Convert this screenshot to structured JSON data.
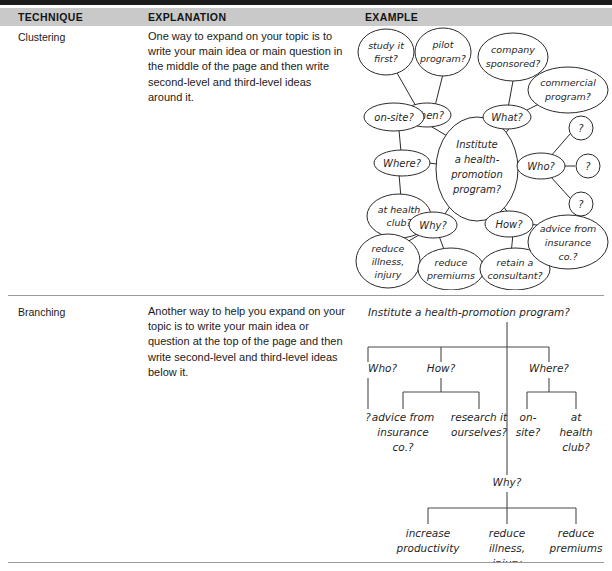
{
  "table": {
    "headers": {
      "technique": "TECHNIQUE",
      "explanation": "EXPLANATION",
      "example": "EXAMPLE"
    },
    "rows": [
      {
        "technique": "Clustering",
        "explanation": "One way to expand on your topic is to write your main idea or main question in the middle of the page and then write second-level and third-level ideas around it."
      },
      {
        "technique": "Branching",
        "explanation": "Another way to help you expand on your topic is to write your main idea or question at the top of the page and then write second-level and third-level ideas below it."
      }
    ]
  },
  "clustering_diagram": {
    "center": "Institute a health-promotion program?",
    "center_lines": [
      "Institute",
      "a health-",
      "promotion",
      "program?"
    ],
    "branches": [
      {
        "label": "When?",
        "children": [
          "study it first?",
          "pilot program?"
        ]
      },
      {
        "label": "What?",
        "children": [
          "company sponsored?",
          "commercial program?"
        ]
      },
      {
        "label": "Who?",
        "children": [
          "?",
          "?",
          "?"
        ]
      },
      {
        "label": "Where?",
        "children": [
          "on-site?",
          "at health club?"
        ]
      },
      {
        "label": "Why?",
        "children": [
          "reduce illness, injury",
          "reduce premiums"
        ]
      },
      {
        "label": "How?",
        "children": [
          "retain a consultant?",
          "advice from insurance co.?"
        ]
      }
    ],
    "nodes": {
      "study_it_first_l1": "study it",
      "study_it_first_l2": "first?",
      "pilot_program_l1": "pilot",
      "pilot_program_l2": "program?",
      "company_sponsored_l1": "company",
      "company_sponsored_l2": "sponsored?",
      "commercial_program_l1": "commercial",
      "commercial_program_l2": "program?",
      "when": "When?",
      "what": "What?",
      "on_site": "on-site?",
      "where": "Where?",
      "at_health_club_l1": "at health",
      "at_health_club_l2": "club?",
      "who": "Who?",
      "q1": "?",
      "q2": "?",
      "q3": "?",
      "why": "Why?",
      "how": "How?",
      "reduce_illness_l1": "reduce",
      "reduce_illness_l2": "illness,",
      "reduce_illness_l3": "injury",
      "reduce_premiums_l1": "reduce",
      "reduce_premiums_l2": "premiums",
      "retain_consultant_l1": "retain a",
      "retain_consultant_l2": "consultant?",
      "advice_insurance_l1": "advice from",
      "advice_insurance_l2": "insurance",
      "advice_insurance_l3": "co.?"
    }
  },
  "branching_diagram": {
    "root": "Institute a health-promotion program?",
    "level2": [
      "Who?",
      "How?",
      "Where?"
    ],
    "level3": {
      "who_children": [
        "?"
      ],
      "how_children": [
        "advice from insurance co.?",
        "research it ourselves?"
      ],
      "where_children": [
        "on-site?",
        "at health club?"
      ]
    },
    "why_branch": {
      "label": "Why?",
      "children": [
        "increase productivity",
        "reduce illness, injury",
        "reduce premiums"
      ]
    },
    "nodes": {
      "root": "Institute a health-promotion program?",
      "who": "Who?",
      "how": "How?",
      "where": "Where?",
      "q_mark": "?",
      "advice_l1": "advice from",
      "advice_l2": "insurance",
      "advice_l3": "co.?",
      "research_l1": "research it",
      "research_l2": "ourselves?",
      "onsite_l1": "on-",
      "onsite_l2": "site?",
      "athealth_l1": "at",
      "athealth_l2": "health",
      "athealth_l3": "club?",
      "why": "Why?",
      "increase_l1": "increase",
      "increase_l2": "productivity",
      "reduceill_l1": "reduce",
      "reduceill_l2": "illness,",
      "reduceill_l3": "injury",
      "reducepre_l1": "reduce",
      "reducepre_l2": "premiums"
    }
  },
  "colors": {
    "header_band": "#c9c9c9",
    "top_bar": "#1c1c1c",
    "rule": "#9a9a9a",
    "ink": "#1f1f1f"
  }
}
